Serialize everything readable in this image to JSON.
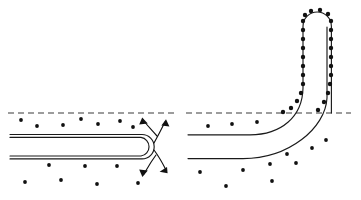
{
  "figure": {
    "background_color": "#ffffff",
    "line_color": "#1a1a1a",
    "particle_color": "#111111",
    "interface_color": "#3a3a3a",
    "width": 361,
    "height": 200
  },
  "interface": {
    "label": "free-surface-dashed-line",
    "y": 113,
    "segments": [
      {
        "x1": 8,
        "x2": 176
      },
      {
        "x1": 186,
        "x2": 351
      }
    ],
    "dash_pattern": "6 4"
  },
  "panel_left": {
    "name": "straight-tube-panel",
    "tube": {
      "name": "straight-tube",
      "outer_path": "M 10 134.5 L 142 134.5 A 12.2 12.2 0 0 1 142 158.9 L 10 158.9",
      "inner_path": "M 10 137.2 L 141 137.2 A 9.6 9.6 0 0 1 141 156.2 L 10 156.2",
      "top_y": 134.5,
      "bottom_y": 158.9,
      "left_x": 10,
      "tip_x": 154
    },
    "particles_above": [
      {
        "cx": 21,
        "cy": 120
      },
      {
        "cx": 37,
        "cy": 126
      },
      {
        "cx": 63,
        "cy": 125
      },
      {
        "cx": 81,
        "cy": 119
      },
      {
        "cx": 98,
        "cy": 124
      },
      {
        "cx": 120,
        "cy": 121
      },
      {
        "cx": 133,
        "cy": 127
      }
    ],
    "particles_below": [
      {
        "cx": 25,
        "cy": 182
      },
      {
        "cx": 49,
        "cy": 165
      },
      {
        "cx": 61,
        "cy": 180
      },
      {
        "cx": 85,
        "cy": 166
      },
      {
        "cx": 97,
        "cy": 184
      },
      {
        "cx": 117,
        "cy": 166
      },
      {
        "cx": 138,
        "cy": 183
      }
    ],
    "flow_arrows": [
      {
        "name": "flow-arrow-upper-inward",
        "path": "M 157 136 C 150 128 146 124 143 120",
        "head": "142.2,117.6 147.4,123.2 139.6,124.0"
      },
      {
        "name": "flow-arrow-upper-outward",
        "path": "M 154 143 C 159 134 162 128 165 122",
        "head": "165.8,119.4 169.2,126.2 161.6,125.0"
      },
      {
        "name": "flow-arrow-lower-inward",
        "path": "M 156 155 C 150 163 147 169 144 174",
        "head": "142.6,176.8 139.6,169.8 147.4,170.8"
      },
      {
        "name": "flow-arrow-lower-outward",
        "path": "M 154 150 C 160 158 163 164 166 170",
        "head": "167.4,172.8 160.0,171.6 166.8,167.4"
      }
    ]
  },
  "panel_right": {
    "name": "bent-tube-panel",
    "tube": {
      "name": "bent-tube",
      "outer_wall_path": "M 188 134.8 L 252 134.8 C 282 134.8 301 116 303 86 L 303 26 A 14.2 14.2 0 0 1 331.4 26 L 331.4 112",
      "inner_wall_path": "M 188 158.6 L 244 158.6 C 288 158.6 324 126 327 96 L 327 28",
      "horizontal_top_y": 134.8,
      "horizontal_bottom_y": 158.6,
      "left_x": 188,
      "vertical_left_x": 303,
      "vertical_right_x": 331,
      "cap_y": 12
    },
    "wall_particles_left": [
      {
        "cx": 303,
        "cy": 20
      },
      {
        "cx": 303,
        "cy": 30
      },
      {
        "cx": 303,
        "cy": 40
      },
      {
        "cx": 303,
        "cy": 50
      },
      {
        "cx": 303,
        "cy": 60
      },
      {
        "cx": 303,
        "cy": 70
      },
      {
        "cx": 303,
        "cy": 80
      },
      {
        "cx": 302,
        "cy": 90
      },
      {
        "cx": 299,
        "cy": 99
      },
      {
        "cx": 294,
        "cy": 107
      },
      {
        "cx": 286,
        "cy": 112
      }
    ],
    "cap_particles": [
      {
        "cx": 306,
        "cy": 15
      },
      {
        "cx": 312,
        "cy": 11
      },
      {
        "cx": 320,
        "cy": 11
      },
      {
        "cx": 327,
        "cy": 15
      }
    ],
    "wall_particles_right": [
      {
        "cx": 331,
        "cy": 22
      },
      {
        "cx": 331,
        "cy": 32
      },
      {
        "cx": 331,
        "cy": 42
      },
      {
        "cx": 331,
        "cy": 52
      },
      {
        "cx": 331,
        "cy": 62
      },
      {
        "cx": 331,
        "cy": 72
      },
      {
        "cx": 330,
        "cy": 82
      },
      {
        "cx": 328,
        "cy": 92
      },
      {
        "cx": 324,
        "cy": 102
      },
      {
        "cx": 318,
        "cy": 110
      }
    ],
    "particles_above": [
      {
        "cx": 208,
        "cy": 126
      },
      {
        "cx": 232,
        "cy": 124
      },
      {
        "cx": 257,
        "cy": 122
      }
    ],
    "particles_below": [
      {
        "cx": 200,
        "cy": 172
      },
      {
        "cx": 243,
        "cy": 170
      },
      {
        "cx": 226,
        "cy": 186
      },
      {
        "cx": 272,
        "cy": 180
      },
      {
        "cx": 270,
        "cy": 164
      },
      {
        "cx": 287,
        "cy": 154
      },
      {
        "cx": 295,
        "cy": 163
      },
      {
        "cx": 313,
        "cy": 148
      },
      {
        "cx": 326,
        "cy": 140
      }
    ]
  }
}
